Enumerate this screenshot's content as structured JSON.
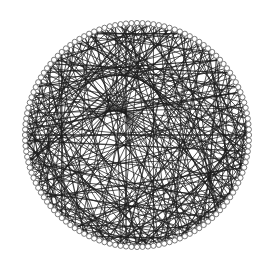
{
  "diagram": {
    "type": "circular-graph",
    "background": "#ffffff",
    "edge_color": "#1c1c1c",
    "node_fill": "#ffffff",
    "node_stroke": "#6a6a6a",
    "center": [
      137,
      135
    ],
    "ring_radius": 112,
    "node_radius": 2.6,
    "node_count": 128,
    "edges": [
      [
        0,
        37
      ],
      [
        0,
        71
      ],
      [
        1,
        58
      ],
      [
        1,
        96
      ],
      [
        2,
        45
      ],
      [
        2,
        83
      ],
      [
        3,
        61
      ],
      [
        3,
        110
      ],
      [
        4,
        29
      ],
      [
        4,
        77
      ],
      [
        5,
        52
      ],
      [
        5,
        99
      ],
      [
        6,
        40
      ],
      [
        6,
        88
      ],
      [
        7,
        66
      ],
      [
        7,
        115
      ],
      [
        8,
        33
      ],
      [
        8,
        74
      ],
      [
        9,
        57
      ],
      [
        9,
        102
      ],
      [
        10,
        48
      ],
      [
        10,
        91
      ],
      [
        11,
        69
      ],
      [
        11,
        120
      ],
      [
        12,
        36
      ],
      [
        12,
        80
      ],
      [
        13,
        60
      ],
      [
        13,
        105
      ],
      [
        14,
        43
      ],
      [
        14,
        94
      ],
      [
        15,
        72
      ],
      [
        15,
        118
      ],
      [
        16,
        50
      ],
      [
        16,
        86
      ],
      [
        17,
        63
      ],
      [
        17,
        108
      ],
      [
        18,
        39
      ],
      [
        18,
        79
      ],
      [
        19,
        55
      ],
      [
        19,
        100
      ],
      [
        20,
        47
      ],
      [
        20,
        92
      ],
      [
        21,
        70
      ],
      [
        21,
        124
      ],
      [
        22,
        34
      ],
      [
        22,
        85
      ],
      [
        23,
        62
      ],
      [
        23,
        111
      ],
      [
        24,
        44
      ],
      [
        24,
        97
      ],
      [
        25,
        67
      ],
      [
        25,
        116
      ],
      [
        26,
        53
      ],
      [
        26,
        89
      ],
      [
        27,
        75
      ],
      [
        27,
        103
      ],
      [
        28,
        41
      ],
      [
        28,
        82
      ],
      [
        29,
        59
      ],
      [
        29,
        106
      ],
      [
        30,
        49
      ],
      [
        30,
        95
      ],
      [
        31,
        73
      ],
      [
        31,
        121
      ],
      [
        32,
        56
      ],
      [
        32,
        87
      ],
      [
        33,
        64
      ],
      [
        33,
        112
      ],
      [
        34,
        46
      ],
      [
        34,
        98
      ],
      [
        35,
        68
      ],
      [
        35,
        117
      ],
      [
        36,
        54
      ],
      [
        36,
        90
      ],
      [
        37,
        76
      ],
      [
        37,
        104
      ],
      [
        38,
        42
      ],
      [
        38,
        84
      ],
      [
        39,
        65
      ],
      [
        39,
        109
      ],
      [
        40,
        51
      ],
      [
        40,
        93
      ],
      [
        41,
        78
      ],
      [
        41,
        122
      ],
      [
        42,
        57
      ],
      [
        42,
        101
      ],
      [
        43,
        70
      ],
      [
        43,
        114
      ],
      [
        44,
        61
      ],
      [
        44,
        88
      ],
      [
        45,
        81
      ],
      [
        45,
        119
      ],
      [
        46,
        63
      ],
      [
        46,
        107
      ],
      [
        47,
        74
      ],
      [
        47,
        125
      ],
      [
        48,
        66
      ],
      [
        48,
        99
      ],
      [
        49,
        85
      ],
      [
        49,
        113
      ],
      [
        50,
        71
      ],
      [
        50,
        96
      ],
      [
        51,
        90
      ],
      [
        51,
        123
      ],
      [
        52,
        77
      ],
      [
        52,
        110
      ],
      [
        53,
        68
      ],
      [
        53,
        102
      ],
      [
        54,
        92
      ],
      [
        54,
        126
      ],
      [
        55,
        80
      ],
      [
        55,
        115
      ],
      [
        56,
        73
      ],
      [
        56,
        105
      ],
      [
        57,
        94
      ],
      [
        58,
        83
      ],
      [
        58,
        118
      ],
      [
        59,
        76
      ],
      [
        59,
        108
      ],
      [
        60,
        97
      ],
      [
        60,
        127
      ],
      [
        61,
        86
      ],
      [
        62,
        79
      ],
      [
        62,
        111
      ],
      [
        63,
        100
      ],
      [
        64,
        89
      ],
      [
        64,
        120
      ],
      [
        65,
        82
      ],
      [
        65,
        114
      ],
      [
        66,
        103
      ],
      [
        67,
        91
      ],
      [
        67,
        124
      ],
      [
        68,
        87
      ],
      [
        69,
        95
      ],
      [
        69,
        117
      ],
      [
        70,
        106
      ],
      [
        71,
        98
      ],
      [
        72,
        84
      ],
      [
        72,
        112
      ],
      [
        73,
        101
      ],
      [
        74,
        109
      ],
      [
        75,
        93
      ],
      [
        75,
        126
      ],
      [
        76,
        119
      ],
      [
        77,
        104
      ],
      [
        78,
        97
      ],
      [
        78,
        0
      ],
      [
        79,
        113
      ],
      [
        80,
        107
      ],
      [
        81,
        100
      ],
      [
        81,
        3
      ],
      [
        82,
        116
      ],
      [
        83,
        110
      ],
      [
        84,
        102
      ],
      [
        84,
        6
      ],
      [
        85,
        121
      ],
      [
        86,
        115
      ],
      [
        87,
        9
      ],
      [
        88,
        124
      ],
      [
        89,
        118
      ],
      [
        90,
        12
      ],
      [
        91,
        127
      ],
      [
        92,
        15
      ],
      [
        93,
        121
      ],
      [
        94,
        18
      ],
      [
        95,
        2
      ],
      [
        96,
        21
      ],
      [
        97,
        5
      ],
      [
        98,
        24
      ],
      [
        99,
        8
      ],
      [
        100,
        27
      ],
      [
        101,
        11
      ],
      [
        102,
        30
      ],
      [
        103,
        14
      ],
      [
        104,
        33
      ],
      [
        105,
        17
      ],
      [
        106,
        36
      ],
      [
        107,
        20
      ],
      [
        108,
        39
      ],
      [
        109,
        23
      ],
      [
        110,
        42
      ],
      [
        111,
        26
      ],
      [
        112,
        45
      ],
      [
        113,
        29
      ],
      [
        114,
        48
      ],
      [
        115,
        32
      ],
      [
        116,
        51
      ],
      [
        117,
        35
      ],
      [
        118,
        54
      ],
      [
        119,
        38
      ],
      [
        120,
        57
      ],
      [
        121,
        41
      ],
      [
        122,
        60
      ],
      [
        123,
        44
      ],
      [
        124,
        63
      ],
      [
        125,
        47
      ],
      [
        126,
        66
      ],
      [
        127,
        50
      ],
      [
        0,
        90
      ],
      [
        4,
        100
      ],
      [
        8,
        112
      ],
      [
        12,
        64
      ],
      [
        16,
        120
      ],
      [
        20,
        110
      ],
      [
        24,
        72
      ],
      [
        28,
        116
      ],
      [
        32,
        96
      ],
      [
        36,
        122
      ],
      [
        40,
        124
      ],
      [
        44,
        16
      ],
      [
        48,
        8
      ],
      [
        52,
        20
      ],
      [
        56,
        4
      ],
      [
        60,
        30
      ],
      [
        64,
        10
      ],
      [
        68,
        22
      ],
      [
        72,
        2
      ],
      [
        76,
        34
      ],
      [
        80,
        14
      ],
      [
        84,
        40
      ],
      [
        88,
        26
      ],
      [
        92,
        48
      ],
      [
        96,
        32
      ],
      [
        100,
        56
      ],
      [
        104,
        62
      ],
      [
        108,
        70
      ],
      [
        112,
        78
      ],
      [
        116,
        86
      ],
      [
        120,
        94
      ],
      [
        124,
        102
      ],
      [
        3,
        47
      ],
      [
        7,
        91
      ],
      [
        11,
        35
      ],
      [
        15,
        59
      ],
      [
        19,
        83
      ],
      [
        23,
        99
      ],
      [
        27,
        55
      ],
      [
        31,
        87
      ],
      [
        35,
        95
      ],
      [
        39,
        11
      ],
      [
        43,
        123
      ],
      [
        47,
        5
      ],
      [
        51,
        17
      ],
      [
        55,
        125
      ],
      [
        59,
        13
      ],
      [
        63,
        31
      ],
      [
        67,
        1
      ],
      [
        71,
        19
      ],
      [
        75,
        43
      ],
      [
        79,
        37
      ],
      [
        83,
        61
      ],
      [
        87,
        53
      ],
      [
        91,
        45
      ],
      [
        95,
        67
      ],
      [
        99,
        73
      ],
      [
        103,
        81
      ],
      [
        107,
        89
      ],
      [
        111,
        93
      ],
      [
        115,
        105
      ],
      [
        119,
        9
      ]
    ]
  }
}
